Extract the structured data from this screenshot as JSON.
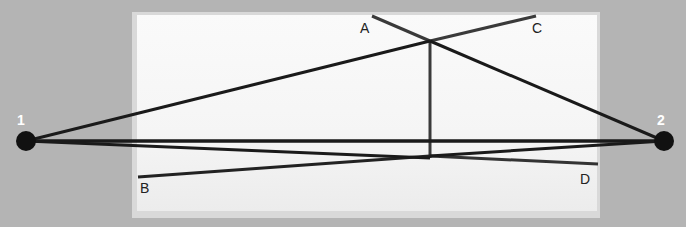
{
  "diagram": {
    "points": [
      {
        "id": "1",
        "label": "1",
        "x": 26,
        "y": 141
      },
      {
        "id": "2",
        "label": "2",
        "x": 664,
        "y": 141
      }
    ],
    "segment_labels": [
      {
        "id": "A",
        "label": "A",
        "x": 360,
        "y": 20
      },
      {
        "id": "B",
        "label": "B",
        "x": 140,
        "y": 181
      },
      {
        "id": "C",
        "label": "C",
        "x": 532,
        "y": 20
      },
      {
        "id": "D",
        "label": "D",
        "x": 582,
        "y": 172
      }
    ],
    "colors": {
      "background": "#b4b4b4",
      "panel": "#f7f7f7",
      "line": "#1a1a1a",
      "segment": "#3a3a3a"
    }
  }
}
